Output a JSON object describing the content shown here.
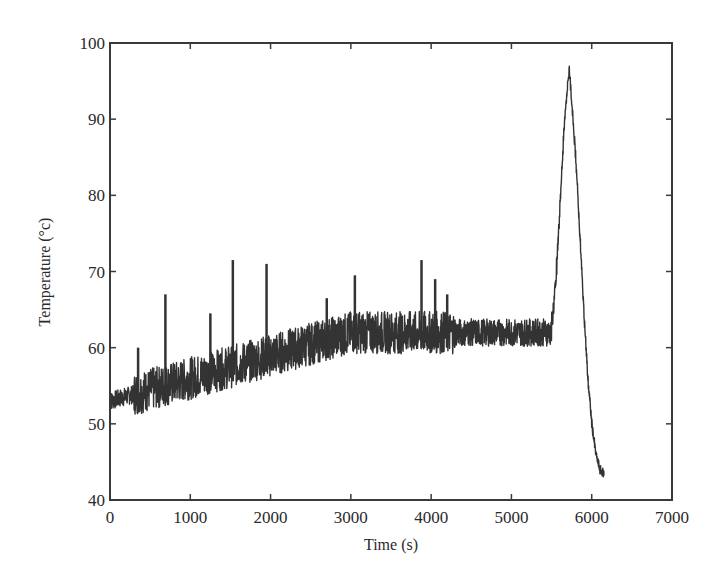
{
  "chart_data": {
    "type": "line",
    "title": "",
    "xlabel": "Time (s)",
    "ylabel": "Temperature (°c)",
    "xlim": [
      0,
      7000
    ],
    "ylim": [
      40,
      100
    ],
    "xticks": [
      0,
      1000,
      2000,
      3000,
      4000,
      5000,
      6000,
      7000
    ],
    "yticks": [
      40,
      50,
      60,
      70,
      80,
      90,
      100
    ],
    "xtick_labels": [
      "0",
      "1000",
      "2000",
      "3000",
      "4000",
      "5000",
      "6000",
      "7000"
    ],
    "ytick_labels": [
      "40",
      "50",
      "60",
      "70",
      "80",
      "90",
      "100"
    ],
    "grid": false,
    "legend": null,
    "series": [
      {
        "name": "Temperature",
        "color": "#333333",
        "x": [
          0,
          100,
          200,
          300,
          350,
          400,
          500,
          600,
          650,
          690,
          700,
          800,
          900,
          1000,
          1100,
          1200,
          1300,
          1400,
          1500,
          1530,
          1600,
          1700,
          1800,
          1900,
          1950,
          2000,
          2100,
          2200,
          2300,
          2400,
          2500,
          2600,
          2700,
          2800,
          2900,
          3000,
          3050,
          3100,
          3200,
          3300,
          3400,
          3500,
          3600,
          3700,
          3800,
          3880,
          3900,
          4000,
          4100,
          4200,
          4300,
          4400,
          4500,
          4600,
          4700,
          4800,
          4900,
          5000,
          5100,
          5200,
          5300,
          5400,
          5500,
          5550,
          5600,
          5650,
          5700,
          5720,
          5750,
          5800,
          5850,
          5900,
          5950,
          6000,
          6050,
          6100,
          6150
        ],
        "y": [
          53,
          53.5,
          54,
          54.5,
          60,
          55,
          55.5,
          55,
          52,
          67,
          56,
          56,
          57,
          57.5,
          58,
          58,
          58,
          58.5,
          59,
          71.5,
          59,
          59.5,
          60,
          60,
          71,
          60,
          60.5,
          61,
          61,
          61,
          61.5,
          61.5,
          61.5,
          62,
          62,
          62,
          69,
          62,
          62,
          62,
          62,
          62,
          62,
          62,
          62,
          71.5,
          62,
          62,
          62.5,
          62.5,
          62,
          62,
          62,
          62,
          62,
          62,
          62,
          62,
          62,
          62,
          62,
          62,
          63,
          68,
          78,
          88,
          95,
          96.5,
          92,
          85,
          75,
          65,
          56,
          50,
          46,
          44,
          43.5
        ],
        "noise_band": {
          "description": "Dense high-frequency fluctuations around the trend, amplitude ~±3 °C from 0–5500 s with isolated spikes",
          "spikes": [
            {
              "x": 350,
              "y": 60
            },
            {
              "x": 690,
              "y": 67
            },
            {
              "x": 1250,
              "y": 64.5
            },
            {
              "x": 1530,
              "y": 71.5
            },
            {
              "x": 1950,
              "y": 71
            },
            {
              "x": 2700,
              "y": 66.5
            },
            {
              "x": 3050,
              "y": 69.5
            },
            {
              "x": 3880,
              "y": 71.5
            },
            {
              "x": 4050,
              "y": 69
            },
            {
              "x": 4200,
              "y": 67
            }
          ]
        }
      }
    ],
    "annotations": []
  }
}
